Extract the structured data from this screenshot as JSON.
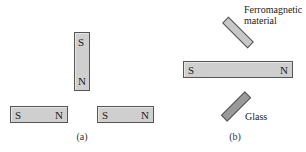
{
  "panel_a": {
    "caption": "(a)",
    "magnets": [
      {
        "name": "vertical",
        "top_pole": "S",
        "bottom_pole": "N"
      },
      {
        "name": "left-horizontal",
        "left_pole": "S",
        "right_pole": "N"
      },
      {
        "name": "right-horizontal",
        "left_pole": "S",
        "right_pole": "N"
      }
    ]
  },
  "panel_b": {
    "caption": "(b)",
    "magnet": {
      "left_pole": "S",
      "right_pole": "N"
    },
    "ferromagnetic_label_line1": "Ferromagnetic",
    "ferromagnetic_label_line2": "material",
    "glass_label": "Glass"
  },
  "colors": {
    "magnet_fill": "#cfcfcf",
    "ferromagnetic_fill": "#c8c8c8",
    "glass_fill": "#9a9a9a",
    "outline": "#555555"
  }
}
